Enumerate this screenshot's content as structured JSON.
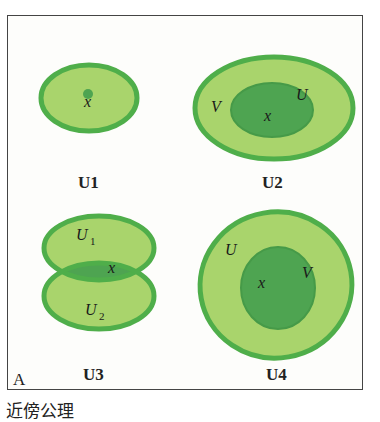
{
  "figure": {
    "corner_label": "A",
    "bottom_caption": "近傍公理",
    "colors": {
      "outline": "#4fae4a",
      "light_fill": "#a9d46c",
      "dark_fill": "#4ea451"
    },
    "panels": [
      {
        "caption": "U1",
        "labels": {
          "point": "x"
        }
      },
      {
        "caption": "U2",
        "labels": {
          "outer": "V",
          "inner": "U",
          "point": "x"
        }
      },
      {
        "caption": "U3",
        "labels": {
          "top": "U",
          "top_sub": "1",
          "bottom": "U",
          "bottom_sub": "2",
          "point": "x"
        }
      },
      {
        "caption": "U4",
        "labels": {
          "outer": "U",
          "inner": "V",
          "point": "x"
        }
      }
    ]
  }
}
